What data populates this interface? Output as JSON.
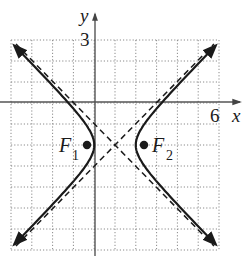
{
  "chart_data": {
    "type": "line",
    "title": "",
    "xlabel": "x",
    "ylabel": "y",
    "xlim": [
      -4,
      6
    ],
    "ylim": [
      -7,
      3
    ],
    "grid": true,
    "grid_style": "dotted",
    "tick_labels": {
      "x": [
        "6"
      ],
      "y": [
        "3"
      ]
    },
    "curve": {
      "name": "hyperbola",
      "equation": "(x-1)^2 - (y+2)^2 = 1",
      "center": [
        1,
        -2
      ],
      "a": 1,
      "b": 1,
      "vertices": [
        [
          0,
          -2
        ],
        [
          2,
          -2
        ]
      ],
      "style": "solid"
    },
    "asymptotes": [
      {
        "equation": "y + 2 = x - 1",
        "style": "dashed"
      },
      {
        "equation": "y + 2 = -(x - 1)",
        "style": "dashed"
      }
    ],
    "foci": [
      {
        "label": "F1",
        "point": [
          -0.414,
          -2
        ]
      },
      {
        "label": "F2",
        "point": [
          2.414,
          -2
        ]
      }
    ]
  },
  "labels": {
    "x_axis": "x",
    "y_axis": "y",
    "x_tick": "6",
    "y_tick": "3",
    "f1_main": "F",
    "f1_sub": "1",
    "f2_main": "F",
    "f2_sub": "2"
  },
  "colors": {
    "ink": "#1a1a1a",
    "grid": "#8a8a8a",
    "axis": "#555555"
  }
}
